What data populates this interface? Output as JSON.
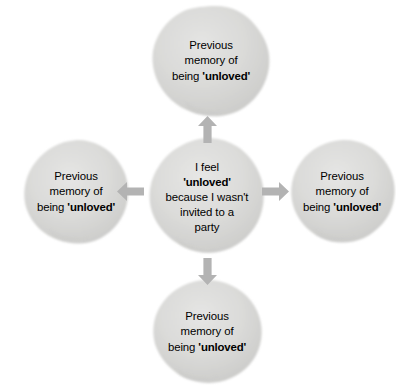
{
  "figure": {
    "type": "cycle-diagram",
    "layout": "cross",
    "background_color": "#ffffff",
    "node_fill_color": "#d7d7d6",
    "node_edge_color": "#c9c9c7",
    "arrow_color": "#b3b3b3",
    "text_color": "#000000"
  },
  "nodes": {
    "center": {
      "id": "center-thought",
      "lines": [
        "I feel",
        "'unloved'",
        "because I wasn't",
        "invited to a",
        "party"
      ],
      "emphasis_line_index": 1,
      "emphasis_word": "'unloved'",
      "full_text": "I feel 'unloved' because I wasn't invited to a party"
    },
    "top": {
      "id": "memory-top",
      "lines": [
        "Previous",
        "memory of",
        "being 'unloved'"
      ],
      "emphasis_word": "'unloved'",
      "full_text": "Previous memory of being 'unloved'"
    },
    "left": {
      "id": "memory-left",
      "lines": [
        "Previous",
        "memory of",
        "being 'unloved'"
      ],
      "emphasis_word": "'unloved'",
      "full_text": "Previous memory of being 'unloved'"
    },
    "right": {
      "id": "memory-right",
      "lines": [
        "Previous",
        "memory of",
        "being 'unloved'"
      ],
      "emphasis_word": "'unloved'",
      "full_text": "Previous memory of being 'unloved'"
    },
    "bottom": {
      "id": "memory-bottom",
      "lines": [
        "Previous",
        "memory of",
        "being 'unloved'"
      ],
      "emphasis_word": "'unloved'",
      "full_text": "Previous memory of being 'unloved'"
    }
  },
  "arrows": [
    {
      "id": "arrow-up",
      "direction": "up",
      "from": "center",
      "to": "top"
    },
    {
      "id": "arrow-down",
      "direction": "down",
      "from": "center",
      "to": "bottom"
    },
    {
      "id": "arrow-left",
      "direction": "left",
      "from": "center",
      "to": "left"
    },
    {
      "id": "arrow-right",
      "direction": "right",
      "from": "center",
      "to": "right"
    }
  ]
}
